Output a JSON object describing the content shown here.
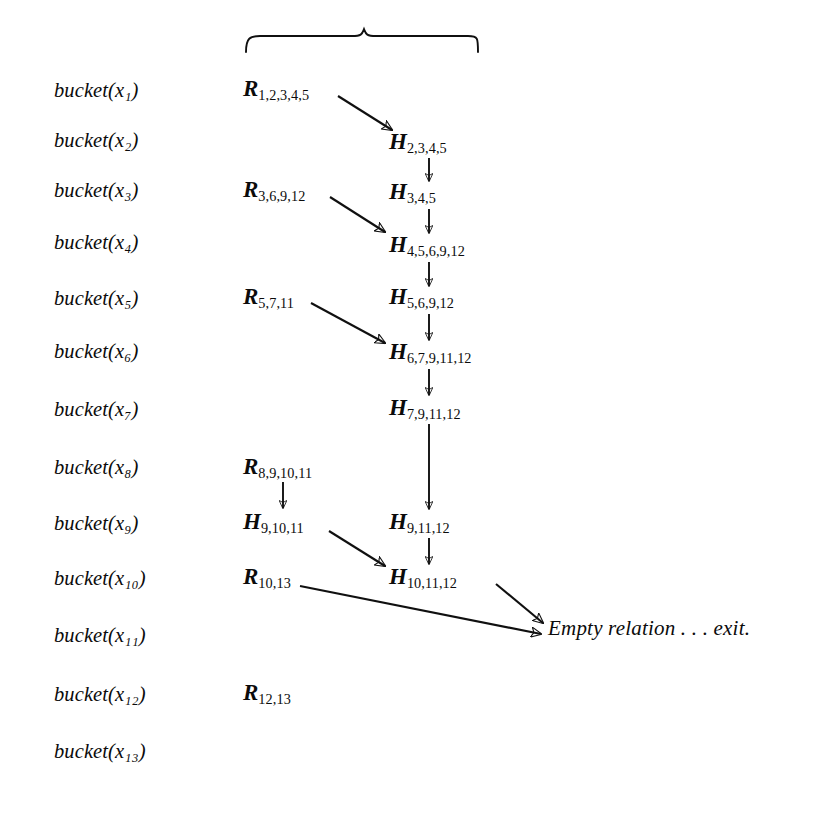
{
  "figure": {
    "type": "algorithm-trace-diagram",
    "background_color": "#ffffff",
    "ink_color": "#101010",
    "brace": {
      "label": "top-grouping-brace",
      "spans_columns": "R and H relation columns"
    }
  },
  "buckets": {
    "column_label": "bucket variables",
    "items": [
      {
        "text": "bucket(x₁)"
      },
      {
        "text": "bucket(x₂)"
      },
      {
        "text": "bucket(x₃)"
      },
      {
        "text": "bucket(x₄)"
      },
      {
        "text": "bucket(x₅)"
      },
      {
        "text": "bucket(x₆)"
      },
      {
        "text": "bucket(x₇)"
      },
      {
        "text": "bucket(x₈)"
      },
      {
        "text": "bucket(x₉)"
      },
      {
        "text": "bucket(x₁₀)"
      },
      {
        "text": "bucket(x₁₁)"
      },
      {
        "text": "bucket(x₁₂)"
      },
      {
        "text": "bucket(x₁₃)"
      }
    ]
  },
  "relations": {
    "input_relations": [
      {
        "head": "R",
        "sub": "1,2,3,4,5",
        "row": 1
      },
      {
        "head": "R",
        "sub": "3,6,9,12",
        "row": 3
      },
      {
        "head": "R",
        "sub": "5,7,11",
        "row": 5
      },
      {
        "head": "R",
        "sub": "8,9,10,11",
        "row": 8
      },
      {
        "head": "R",
        "sub": "10,13",
        "row": 10
      },
      {
        "head": "R",
        "sub": "12,13",
        "row": 12
      }
    ],
    "derived_relations": [
      {
        "head": "H",
        "sub": "2,3,4,5",
        "row": 2
      },
      {
        "head": "H",
        "sub": "3,4,5",
        "row": 3
      },
      {
        "head": "H",
        "sub": "4,5,6,9,12",
        "row": 4
      },
      {
        "head": "H",
        "sub": "5,6,9,12",
        "row": 5
      },
      {
        "head": "H",
        "sub": "6,7,9,11,12",
        "row": 6
      },
      {
        "head": "H",
        "sub": "7,9,11,12",
        "row": 7
      },
      {
        "head": "H",
        "sub": "9,11,12",
        "row": 9
      },
      {
        "head": "H",
        "sub": "10,11,12",
        "row": 10
      }
    ],
    "side_relations": [
      {
        "head": "H",
        "sub": "9,10,11",
        "row": 9
      }
    ]
  },
  "terminal": {
    "text": "Empty relation . . . exit."
  }
}
